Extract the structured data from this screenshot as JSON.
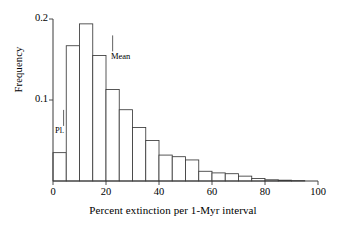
{
  "chart_data": {
    "type": "bar",
    "title": "",
    "xlabel": "Percent extinction per 1-Myr interval",
    "ylabel": "Frequency",
    "xlim": [
      0,
      100
    ],
    "ylim": [
      0,
      0.2
    ],
    "grid": false,
    "legend": null,
    "bin_width": 5,
    "xticks": [
      0,
      20,
      40,
      60,
      80,
      100
    ],
    "xtick_labels": [
      "0",
      "20",
      "40",
      "60",
      "80",
      "100"
    ],
    "yticks": [
      0.1,
      0.2
    ],
    "ytick_labels": [
      "0.1",
      "0.2"
    ],
    "categories": [
      "0-5",
      "5-10",
      "10-15",
      "15-20",
      "20-25",
      "25-30",
      "30-35",
      "35-40",
      "40-45",
      "45-50",
      "50-55",
      "55-60",
      "60-65",
      "65-70",
      "70-75",
      "75-80",
      "80-85",
      "85-90",
      "90-95",
      "95-100"
    ],
    "bin_starts": [
      0,
      5,
      10,
      15,
      20,
      25,
      30,
      35,
      40,
      45,
      50,
      55,
      60,
      65,
      70,
      75,
      80,
      85,
      90,
      95
    ],
    "values": [
      0.035,
      0.167,
      0.194,
      0.155,
      0.113,
      0.088,
      0.066,
      0.05,
      0.032,
      0.03,
      0.026,
      0.012,
      0.01,
      0.009,
      0.006,
      0.003,
      0.0015,
      0.001,
      0.0005,
      0.0
    ],
    "annotations": [
      {
        "name": "Pl.",
        "label": "Pl.",
        "x": 4.0,
        "y": 0.068,
        "marker": "down-tick"
      },
      {
        "name": "Mean",
        "label": "Mean",
        "x": 22.5,
        "y": 0.16,
        "marker": "down-tick"
      }
    ],
    "bar_fill": "#ffffff",
    "bar_stroke": "#3a3a3a",
    "axis_color": "#3a3a3a"
  }
}
